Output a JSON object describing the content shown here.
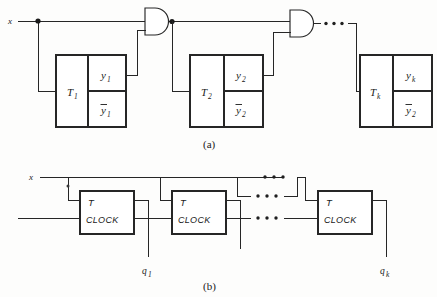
{
  "figure": {
    "caption_a": "(a)",
    "caption_b": "(b)",
    "input_label_a": "x",
    "input_label_b": "x",
    "ellipsis": "• • •",
    "colors": {
      "ink": "#262626",
      "background": "#fdfdfc",
      "junction": "#1a1a1a"
    }
  },
  "part_a": {
    "blocks": [
      {
        "t_label": "T",
        "t_sub": "1",
        "y_label": "y",
        "y_sub": "1",
        "ybar_label": "y",
        "ybar_sub": "1"
      },
      {
        "t_label": "T",
        "t_sub": "2",
        "y_label": "y",
        "y_sub": "2",
        "ybar_label": "y",
        "ybar_sub": "2"
      },
      {
        "t_label": "T",
        "t_sub": "k",
        "y_label": "y",
        "y_sub": "k",
        "ybar_label": "y",
        "ybar_sub": "2"
      }
    ],
    "gates": [
      {
        "type": "and-gate",
        "name": "and-gate-1"
      },
      {
        "type": "and-gate",
        "name": "and-gate-2"
      }
    ],
    "junction_count": 2,
    "ellipsis_dots": 3
  },
  "part_b": {
    "flipflops": [
      {
        "t_label": "T",
        "clock_label": "CLOCK",
        "out_label": "q",
        "out_sub": "1"
      },
      {
        "t_label": "T",
        "clock_label": "CLOCK",
        "out_label": "",
        "out_sub": ""
      },
      {
        "t_label": "T",
        "clock_label": "CLOCK",
        "out_label": "q",
        "out_sub": "k"
      }
    ],
    "ellipsis_rows": 3,
    "ellipsis_dots": 3,
    "junction_count": 1
  }
}
